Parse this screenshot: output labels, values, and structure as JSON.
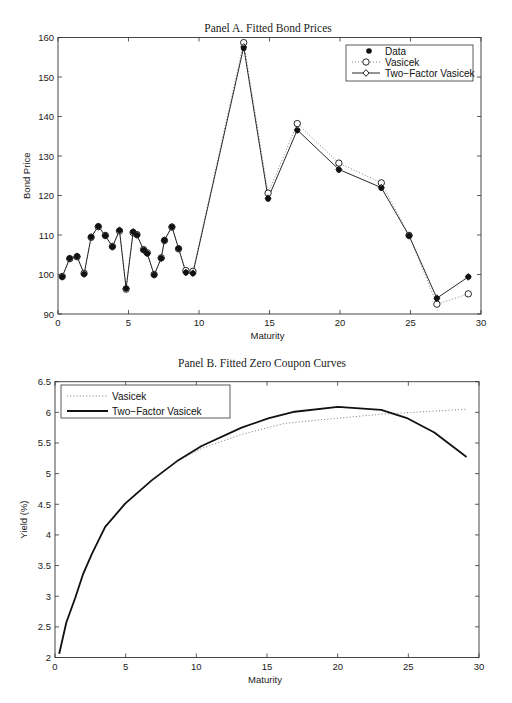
{
  "page": {
    "header_fragment": "",
    "footer_fragment": ""
  },
  "chart_data": [
    {
      "type": "line",
      "title": "Panel A. Fitted Bond Prices",
      "xlabel": "Maturity",
      "ylabel": "Bond Price",
      "xlim": [
        0,
        30
      ],
      "ylim": [
        90,
        160
      ],
      "xticks": [
        0,
        5,
        10,
        15,
        20,
        25,
        30
      ],
      "yticks": [
        90,
        100,
        110,
        120,
        130,
        140,
        150,
        160
      ],
      "grid": false,
      "legend_position": "upper right",
      "legend": [
        "Data",
        "Vasicek",
        "Two−Factor Vasicek"
      ],
      "x": [
        0.3,
        0.83,
        1.35,
        1.85,
        2.35,
        2.86,
        3.36,
        3.86,
        4.36,
        4.83,
        5.33,
        5.6,
        6.07,
        6.33,
        6.82,
        7.32,
        7.55,
        8.08,
        8.55,
        9.07,
        9.57,
        13.17,
        14.9,
        16.97,
        19.92,
        22.93,
        24.9,
        26.87,
        29.1
      ],
      "series": [
        {
          "name": "Data",
          "style": "marker-star",
          "values": [
            99.4,
            104.1,
            104.6,
            100.1,
            109.5,
            112.2,
            109.8,
            107.0,
            111.2,
            96.5,
            110.8,
            110.0,
            106.2,
            105.3,
            99.9,
            104.1,
            108.7,
            112.1,
            106.6,
            100.5,
            100.3,
            157.3,
            119.2,
            136.5,
            126.5,
            121.9,
            109.8,
            94.0,
            99.4
          ]
        },
        {
          "name": "Vasicek",
          "style": "dotted-circle",
          "values": [
            99.5,
            104.0,
            104.5,
            100.3,
            109.4,
            112.1,
            109.9,
            107.1,
            111.0,
            96.3,
            110.6,
            110.1,
            106.3,
            105.5,
            100.0,
            104.2,
            108.6,
            112.0,
            106.5,
            101.0,
            100.8,
            158.7,
            120.6,
            138.2,
            128.2,
            123.2,
            109.9,
            92.5,
            95.1
          ]
        },
        {
          "name": "Two−Factor Vasicek",
          "style": "solid-diamond",
          "values": [
            99.4,
            104.1,
            104.6,
            100.1,
            109.5,
            112.2,
            109.8,
            107.0,
            111.2,
            96.5,
            110.8,
            110.0,
            106.2,
            105.3,
            99.9,
            104.1,
            108.7,
            112.1,
            106.6,
            100.5,
            100.3,
            157.6,
            119.3,
            136.6,
            126.6,
            122.0,
            109.8,
            94.0,
            99.4
          ]
        }
      ]
    },
    {
      "type": "line",
      "title": "Panel B. Fitted Zero Coupon Curves",
      "xlabel": "Maturity",
      "ylabel": "Yield (%)",
      "xlim": [
        0,
        30
      ],
      "ylim": [
        2,
        6.5
      ],
      "xticks": [
        0,
        5,
        10,
        15,
        20,
        25,
        30
      ],
      "yticks": [
        2,
        2.5,
        3,
        3.5,
        4,
        4.5,
        5,
        5.5,
        6,
        6.5
      ],
      "grid": false,
      "legend_position": "upper left",
      "legend": [
        "Vasicek",
        "Two−Factor Vasicek"
      ],
      "series": [
        {
          "name": "Vasicek",
          "style": "dotted",
          "x": [
            0.3,
            0.8,
            1.44,
            2.0,
            2.61,
            3.55,
            4.96,
            6.84,
            8.73,
            10.37,
            13.2,
            16.25,
            19.78,
            23.08,
            26.84,
            29.12
          ],
          "values": [
            2.06,
            2.55,
            2.98,
            3.35,
            3.69,
            4.12,
            4.5,
            4.89,
            5.22,
            5.41,
            5.64,
            5.82,
            5.9,
            5.97,
            6.02,
            6.05
          ]
        },
        {
          "name": "Two−Factor Vasicek",
          "style": "solid",
          "x": [
            0.3,
            0.8,
            1.44,
            2.0,
            2.61,
            3.55,
            4.96,
            6.84,
            8.73,
            10.37,
            13.2,
            15.08,
            16.96,
            20.02,
            23.08,
            24.96,
            26.84,
            29.12
          ],
          "values": [
            2.06,
            2.57,
            2.98,
            3.37,
            3.69,
            4.13,
            4.51,
            4.89,
            5.22,
            5.45,
            5.75,
            5.9,
            6.01,
            6.09,
            6.04,
            5.9,
            5.67,
            5.27
          ]
        }
      ]
    }
  ],
  "colors": {
    "axis": "#333333",
    "line": "#111111",
    "dotted": "#777777",
    "background": "#ffffff"
  }
}
